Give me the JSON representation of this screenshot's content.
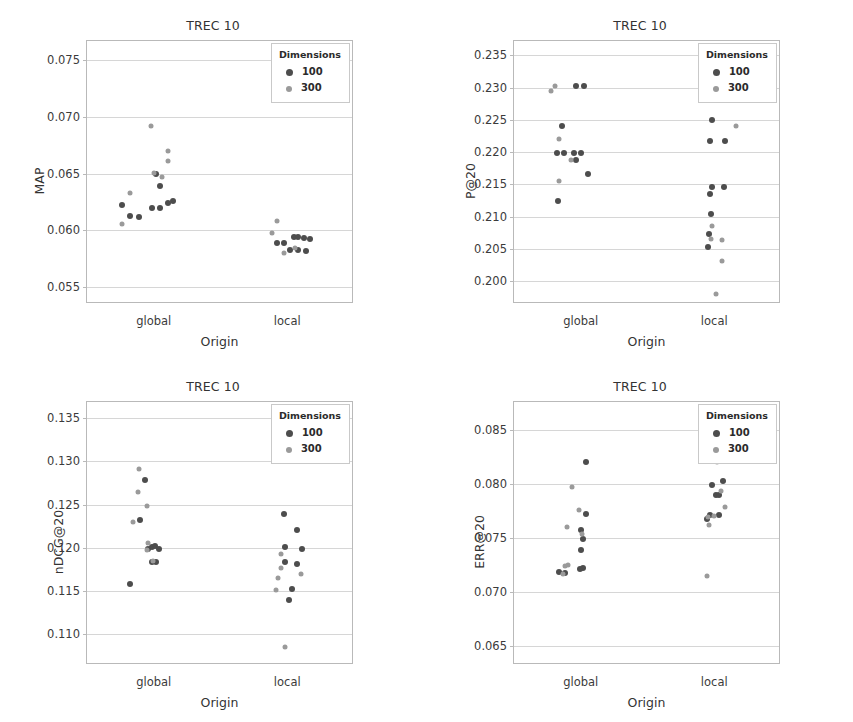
{
  "figure": {
    "width": 853,
    "height": 722,
    "background": "#ffffff",
    "colors": {
      "dim_100": "#4d4d4d",
      "dim_300": "#9a9a9a",
      "axis": "#b9b9b9",
      "grid": "#d6d6d6",
      "text": "#333333"
    }
  },
  "legend": {
    "title": "Dimensions",
    "entries": [
      {
        "label": "100",
        "color": "#4d4d4d"
      },
      {
        "label": "300",
        "color": "#9a9a9a"
      }
    ]
  },
  "chart_data": [
    {
      "id": "map",
      "type": "scatter",
      "title": "TREC 10",
      "xlabel": "Origin",
      "ylabel": "MAP",
      "categories": [
        "global",
        "local"
      ],
      "yticks": [
        0.055,
        0.06,
        0.065,
        0.07,
        0.075
      ],
      "ytick_labels": [
        "0.055",
        "0.060",
        "0.065",
        "0.070",
        "0.075"
      ],
      "ylim": [
        0.0535,
        0.0767
      ],
      "grid": true,
      "legend_position": "top-right",
      "series": [
        {
          "name": "100",
          "color": "#4d4d4d",
          "points": [
            {
              "x": "global",
              "jitter": -0.3,
              "y": 0.0622
            },
            {
              "x": "global",
              "jitter": -0.22,
              "y": 0.0613
            },
            {
              "x": "global",
              "jitter": -0.14,
              "y": 0.0612
            },
            {
              "x": "global",
              "jitter": -0.02,
              "y": 0.062
            },
            {
              "x": "global",
              "jitter": 0.06,
              "y": 0.062
            },
            {
              "x": "global",
              "jitter": 0.13,
              "y": 0.0624
            },
            {
              "x": "global",
              "jitter": 0.18,
              "y": 0.0626
            },
            {
              "x": "global",
              "jitter": 0.06,
              "y": 0.0639
            },
            {
              "x": "global",
              "jitter": 0.02,
              "y": 0.065
            },
            {
              "x": "local",
              "jitter": -0.1,
              "y": 0.0589
            },
            {
              "x": "local",
              "jitter": -0.03,
              "y": 0.0589
            },
            {
              "x": "local",
              "jitter": 0.06,
              "y": 0.0594
            },
            {
              "x": "local",
              "jitter": 0.1,
              "y": 0.0594
            },
            {
              "x": "local",
              "jitter": 0.16,
              "y": 0.0593
            },
            {
              "x": "local",
              "jitter": 0.21,
              "y": 0.0592
            },
            {
              "x": "local",
              "jitter": 0.03,
              "y": 0.0583
            },
            {
              "x": "local",
              "jitter": 0.1,
              "y": 0.0583
            },
            {
              "x": "local",
              "jitter": 0.18,
              "y": 0.0582
            }
          ]
        },
        {
          "name": "300",
          "color": "#9a9a9a",
          "points": [
            {
              "x": "global",
              "jitter": -0.3,
              "y": 0.0606
            },
            {
              "x": "global",
              "jitter": -0.22,
              "y": 0.0633
            },
            {
              "x": "global",
              "jitter": -0.03,
              "y": 0.0692
            },
            {
              "x": "global",
              "jitter": 0.13,
              "y": 0.067
            },
            {
              "x": "global",
              "jitter": 0.13,
              "y": 0.0661
            },
            {
              "x": "global",
              "jitter": 0.08,
              "y": 0.0647
            },
            {
              "x": "global",
              "jitter": 0.0,
              "y": 0.0651
            },
            {
              "x": "local",
              "jitter": -0.1,
              "y": 0.0608
            },
            {
              "x": "local",
              "jitter": -0.14,
              "y": 0.0598
            },
            {
              "x": "local",
              "jitter": -0.03,
              "y": 0.058
            },
            {
              "x": "local",
              "jitter": 0.07,
              "y": 0.0584
            }
          ]
        }
      ]
    },
    {
      "id": "p20",
      "type": "scatter",
      "title": "TREC 10",
      "xlabel": "Origin",
      "ylabel": "P@20",
      "categories": [
        "global",
        "local"
      ],
      "yticks": [
        0.2,
        0.205,
        0.21,
        0.215,
        0.22,
        0.225,
        0.23,
        0.235
      ],
      "ytick_labels": [
        "0.200",
        "0.205",
        "0.210",
        "0.215",
        "0.220",
        "0.225",
        "0.230",
        "0.235"
      ],
      "ylim": [
        0.1965,
        0.2372
      ],
      "grid": true,
      "legend_position": "top-right",
      "series": [
        {
          "name": "100",
          "color": "#4d4d4d",
          "points": [
            {
              "x": "global",
              "jitter": -0.04,
              "y": 0.2303
            },
            {
              "x": "global",
              "jitter": 0.03,
              "y": 0.2303
            },
            {
              "x": "global",
              "jitter": -0.18,
              "y": 0.224
            },
            {
              "x": "global",
              "jitter": -0.22,
              "y": 0.2198
            },
            {
              "x": "global",
              "jitter": -0.16,
              "y": 0.2198
            },
            {
              "x": "global",
              "jitter": -0.06,
              "y": 0.2198
            },
            {
              "x": "global",
              "jitter": 0.0,
              "y": 0.2198
            },
            {
              "x": "global",
              "jitter": -0.04,
              "y": 0.2188
            },
            {
              "x": "global",
              "jitter": 0.07,
              "y": 0.2166
            },
            {
              "x": "global",
              "jitter": -0.21,
              "y": 0.2125
            },
            {
              "x": "local",
              "jitter": -0.02,
              "y": 0.225
            },
            {
              "x": "local",
              "jitter": -0.04,
              "y": 0.2218
            },
            {
              "x": "local",
              "jitter": 0.1,
              "y": 0.2218
            },
            {
              "x": "local",
              "jitter": -0.02,
              "y": 0.2146
            },
            {
              "x": "local",
              "jitter": 0.09,
              "y": 0.2146
            },
            {
              "x": "local",
              "jitter": -0.04,
              "y": 0.2135
            },
            {
              "x": "local",
              "jitter": -0.03,
              "y": 0.2104
            },
            {
              "x": "local",
              "jitter": -0.05,
              "y": 0.2073
            },
            {
              "x": "local",
              "jitter": -0.06,
              "y": 0.2053
            }
          ]
        },
        {
          "name": "300",
          "color": "#9a9a9a",
          "points": [
            {
              "x": "global",
              "jitter": -0.24,
              "y": 0.2302
            },
            {
              "x": "global",
              "jitter": -0.28,
              "y": 0.2294
            },
            {
              "x": "global",
              "jitter": -0.2,
              "y": 0.222
            },
            {
              "x": "global",
              "jitter": -0.09,
              "y": 0.2188
            },
            {
              "x": "global",
              "jitter": -0.2,
              "y": 0.2156
            },
            {
              "x": "local",
              "jitter": 0.2,
              "y": 0.224
            },
            {
              "x": "local",
              "jitter": -0.02,
              "y": 0.2085
            },
            {
              "x": "local",
              "jitter": -0.03,
              "y": 0.2065
            },
            {
              "x": "local",
              "jitter": 0.07,
              "y": 0.2064
            },
            {
              "x": "local",
              "jitter": 0.07,
              "y": 0.2031
            },
            {
              "x": "local",
              "jitter": 0.02,
              "y": 0.1981
            }
          ]
        }
      ]
    },
    {
      "id": "ndcg20",
      "type": "scatter",
      "title": "TREC 10",
      "xlabel": "Origin",
      "ylabel": "nDCG@20",
      "categories": [
        "global",
        "local"
      ],
      "yticks": [
        0.11,
        0.115,
        0.12,
        0.125,
        0.13,
        0.135
      ],
      "ytick_labels": [
        "0.110",
        "0.115",
        "0.120",
        "0.125",
        "0.130",
        "0.135"
      ],
      "ylim": [
        0.1064,
        0.1369
      ],
      "grid": true,
      "legend_position": "top-right",
      "series": [
        {
          "name": "100",
          "color": "#4d4d4d",
          "points": [
            {
              "x": "global",
              "jitter": -0.08,
              "y": 0.1279
            },
            {
              "x": "global",
              "jitter": -0.13,
              "y": 0.1232
            },
            {
              "x": "global",
              "jitter": -0.02,
              "y": 0.1201
            },
            {
              "x": "global",
              "jitter": 0.01,
              "y": 0.1202
            },
            {
              "x": "global",
              "jitter": 0.05,
              "y": 0.1198
            },
            {
              "x": "global",
              "jitter": -0.05,
              "y": 0.1199
            },
            {
              "x": "global",
              "jitter": -0.02,
              "y": 0.1183
            },
            {
              "x": "global",
              "jitter": 0.02,
              "y": 0.1183
            },
            {
              "x": "global",
              "jitter": -0.22,
              "y": 0.1158
            },
            {
              "x": "local",
              "jitter": -0.03,
              "y": 0.1239
            },
            {
              "x": "local",
              "jitter": 0.09,
              "y": 0.122
            },
            {
              "x": "local",
              "jitter": -0.02,
              "y": 0.1201
            },
            {
              "x": "local",
              "jitter": 0.14,
              "y": 0.1198
            },
            {
              "x": "local",
              "jitter": -0.02,
              "y": 0.1183
            },
            {
              "x": "local",
              "jitter": 0.09,
              "y": 0.1181
            },
            {
              "x": "local",
              "jitter": 0.04,
              "y": 0.1152
            },
            {
              "x": "local",
              "jitter": 0.02,
              "y": 0.1139
            }
          ]
        },
        {
          "name": "300",
          "color": "#9a9a9a",
          "points": [
            {
              "x": "global",
              "jitter": -0.14,
              "y": 0.1291
            },
            {
              "x": "global",
              "jitter": -0.15,
              "y": 0.1265
            },
            {
              "x": "global",
              "jitter": -0.06,
              "y": 0.1248
            },
            {
              "x": "global",
              "jitter": -0.19,
              "y": 0.123
            },
            {
              "x": "global",
              "jitter": -0.05,
              "y": 0.1206
            },
            {
              "x": "global",
              "jitter": -0.06,
              "y": 0.1197
            },
            {
              "x": "global",
              "jitter": -0.01,
              "y": 0.1185
            },
            {
              "x": "local",
              "jitter": -0.06,
              "y": 0.1193
            },
            {
              "x": "local",
              "jitter": -0.06,
              "y": 0.1176
            },
            {
              "x": "local",
              "jitter": -0.09,
              "y": 0.1165
            },
            {
              "x": "local",
              "jitter": 0.13,
              "y": 0.117
            },
            {
              "x": "local",
              "jitter": -0.11,
              "y": 0.1151
            },
            {
              "x": "local",
              "jitter": -0.02,
              "y": 0.1085
            }
          ]
        }
      ]
    },
    {
      "id": "err20",
      "type": "scatter",
      "title": "TREC 10",
      "xlabel": "Origin",
      "ylabel": "ERR@20",
      "categories": [
        "global",
        "local"
      ],
      "yticks": [
        0.065,
        0.07,
        0.075,
        0.08,
        0.085
      ],
      "ytick_labels": [
        "0.065",
        "0.070",
        "0.075",
        "0.080",
        "0.085"
      ],
      "ylim": [
        0.0632,
        0.0876
      ],
      "grid": true,
      "legend_position": "top-right",
      "series": [
        {
          "name": "100",
          "color": "#4d4d4d",
          "points": [
            {
              "x": "global",
              "jitter": 0.05,
              "y": 0.082
            },
            {
              "x": "global",
              "jitter": 0.05,
              "y": 0.0772
            },
            {
              "x": "global",
              "jitter": 0.0,
              "y": 0.0757
            },
            {
              "x": "global",
              "jitter": 0.02,
              "y": 0.0749
            },
            {
              "x": "global",
              "jitter": 0.0,
              "y": 0.0739
            },
            {
              "x": "global",
              "jitter": 0.02,
              "y": 0.0722
            },
            {
              "x": "global",
              "jitter": -0.01,
              "y": 0.0721
            },
            {
              "x": "global",
              "jitter": -0.2,
              "y": 0.0718
            },
            {
              "x": "global",
              "jitter": -0.15,
              "y": 0.0717
            },
            {
              "x": "local",
              "jitter": 0.07,
              "y": 0.084
            },
            {
              "x": "local",
              "jitter": 0.08,
              "y": 0.0803
            },
            {
              "x": "local",
              "jitter": -0.02,
              "y": 0.0799
            },
            {
              "x": "local",
              "jitter": 0.02,
              "y": 0.079
            },
            {
              "x": "local",
              "jitter": 0.04,
              "y": 0.079
            },
            {
              "x": "local",
              "jitter": 0.04,
              "y": 0.0771
            },
            {
              "x": "local",
              "jitter": -0.04,
              "y": 0.0771
            },
            {
              "x": "local",
              "jitter": -0.07,
              "y": 0.0767
            }
          ]
        },
        {
          "name": "300",
          "color": "#9a9a9a",
          "points": [
            {
              "x": "global",
              "jitter": -0.08,
              "y": 0.0797
            },
            {
              "x": "global",
              "jitter": -0.02,
              "y": 0.0776
            },
            {
              "x": "global",
              "jitter": -0.13,
              "y": 0.076
            },
            {
              "x": "global",
              "jitter": 0.01,
              "y": 0.0754
            },
            {
              "x": "global",
              "jitter": -0.12,
              "y": 0.0725
            },
            {
              "x": "global",
              "jitter": -0.15,
              "y": 0.0724
            },
            {
              "x": "global",
              "jitter": -0.17,
              "y": 0.0716
            },
            {
              "x": "local",
              "jitter": 0.0,
              "y": 0.0829
            },
            {
              "x": "local",
              "jitter": 0.0,
              "y": 0.0827
            },
            {
              "x": "local",
              "jitter": 0.03,
              "y": 0.082
            },
            {
              "x": "local",
              "jitter": 0.06,
              "y": 0.0793
            },
            {
              "x": "local",
              "jitter": 0.0,
              "y": 0.077
            },
            {
              "x": "local",
              "jitter": -0.06,
              "y": 0.0769
            },
            {
              "x": "local",
              "jitter": -0.05,
              "y": 0.0762
            },
            {
              "x": "local",
              "jitter": 0.1,
              "y": 0.0779
            },
            {
              "x": "local",
              "jitter": -0.07,
              "y": 0.0715
            }
          ]
        }
      ]
    }
  ]
}
